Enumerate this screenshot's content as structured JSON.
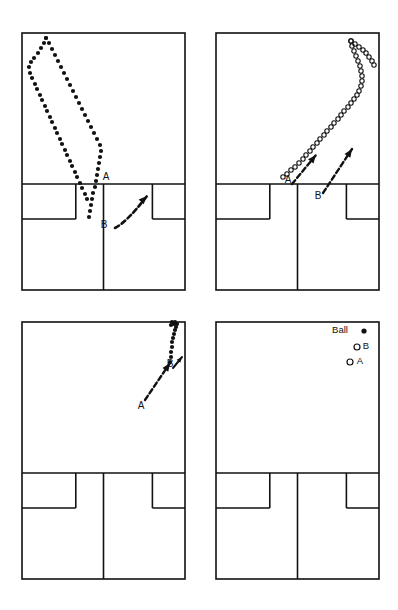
{
  "figure": {
    "type": "diagram",
    "background_color": "#ffffff",
    "line_color": "#111111",
    "panel_count": 4,
    "panel_grid": {
      "rows": 2,
      "cols": 2
    }
  },
  "court": {
    "description": "half badminton court viewed from above, drawn as outer rectangle with net line, short service line, centre line and two service boxes",
    "stroke_color": "#111111",
    "stroke_width": 1.6
  },
  "panels": [
    {
      "id": "panel-1",
      "position": "top-left",
      "x": 22,
      "y": 33,
      "w": 163,
      "h": 257,
      "net_y": 184,
      "service_line_y": 219,
      "labels": [
        {
          "name": "label-a",
          "text": "A",
          "x": 106,
          "y": 180
        },
        {
          "name": "label-b",
          "text": "B",
          "x": 104,
          "y": 228
        }
      ],
      "marker_style": "filled",
      "trajectories": [
        {
          "name": "ball-trajectory-outbound",
          "marker": "filled-dot",
          "points": [
            [
              87,
              199
            ],
            [
              85,
              194
            ],
            [
              82,
              188
            ],
            [
              80,
              183
            ],
            [
              77,
              177
            ],
            [
              75,
              172
            ],
            [
              72,
              166
            ],
            [
              70,
              161
            ],
            [
              67,
              155
            ],
            [
              65,
              150
            ],
            [
              62,
              144
            ],
            [
              60,
              139
            ],
            [
              57,
              133
            ],
            [
              55,
              128
            ],
            [
              52,
              122
            ],
            [
              50,
              117
            ],
            [
              47,
              111
            ],
            [
              45,
              106
            ],
            [
              42,
              100
            ],
            [
              40,
              95
            ],
            [
              37,
              89
            ],
            [
              35,
              84
            ],
            [
              32,
              78
            ],
            [
              30,
              73
            ],
            [
              29,
              67
            ],
            [
              31,
              62
            ],
            [
              34,
              58
            ],
            [
              38,
              53
            ],
            [
              41,
              48
            ],
            [
              44,
              43
            ],
            [
              46,
              38
            ]
          ]
        },
        {
          "name": "ball-trajectory-return",
          "marker": "filled-dot",
          "points": [
            [
              46,
              38
            ],
            [
              49,
              43
            ],
            [
              52,
              49
            ],
            [
              55,
              55
            ],
            [
              58,
              61
            ],
            [
              61,
              67
            ],
            [
              64,
              73
            ],
            [
              67,
              79
            ],
            [
              70,
              85
            ],
            [
              73,
              91
            ],
            [
              76,
              97
            ],
            [
              79,
              103
            ],
            [
              82,
              109
            ],
            [
              85,
              115
            ],
            [
              88,
              121
            ],
            [
              91,
              127
            ],
            [
              94,
              133
            ],
            [
              97,
              139
            ],
            [
              100,
              145
            ],
            [
              101,
              151
            ],
            [
              100,
              157
            ],
            [
              99,
              163
            ],
            [
              98,
              169
            ],
            [
              97,
              175
            ],
            [
              96,
              181
            ],
            [
              95,
              187
            ],
            [
              93,
              193
            ],
            [
              92,
              199
            ],
            [
              91,
              205
            ],
            [
              90,
              211
            ],
            [
              89,
              217
            ]
          ]
        }
      ],
      "arrows": [
        {
          "name": "player-b-move-arrow",
          "style": "dashed-curved",
          "from": [
            115,
            228
          ],
          "to": [
            147,
            196
          ],
          "label": "B"
        }
      ]
    },
    {
      "id": "panel-2",
      "position": "top-right",
      "x": 216,
      "y": 33,
      "w": 163,
      "h": 257,
      "net_y": 184,
      "service_line_y": 219,
      "labels": [
        {
          "name": "label-a",
          "text": "A",
          "x": 288,
          "y": 183
        },
        {
          "name": "label-b",
          "text": "B",
          "x": 318,
          "y": 199
        }
      ],
      "marker_style": "open",
      "trajectories": [
        {
          "name": "ball-trajectory-outbound",
          "marker": "open-circle",
          "points": [
            [
              283,
              177
            ],
            [
              287,
              174
            ],
            [
              291,
              170
            ],
            [
              295,
              167
            ],
            [
              299,
              163
            ],
            [
              303,
              159
            ],
            [
              306,
              155
            ],
            [
              310,
              151
            ],
            [
              313,
              147
            ],
            [
              317,
              143
            ],
            [
              320,
              139
            ],
            [
              324,
              135
            ],
            [
              327,
              131
            ],
            [
              331,
              127
            ],
            [
              334,
              123
            ],
            [
              338,
              119
            ],
            [
              341,
              115
            ],
            [
              344,
              111
            ],
            [
              348,
              107
            ],
            [
              351,
              103
            ],
            [
              354,
              99
            ],
            [
              357,
              95
            ],
            [
              359,
              91
            ],
            [
              361,
              86
            ],
            [
              362,
              81
            ],
            [
              362,
              76
            ],
            [
              361,
              71
            ],
            [
              360,
              66
            ],
            [
              358,
              61
            ],
            [
              356,
              56
            ],
            [
              354,
              51
            ],
            [
              352,
              46
            ],
            [
              351,
              41
            ]
          ]
        },
        {
          "name": "ball-trajectory-return",
          "marker": "open-circle",
          "points": [
            [
              351,
              41
            ],
            [
              355,
              44
            ],
            [
              359,
              47
            ],
            [
              363,
              50
            ],
            [
              366,
              53
            ],
            [
              369,
              57
            ],
            [
              372,
              61
            ],
            [
              374,
              65
            ]
          ]
        }
      ],
      "arrows": [
        {
          "name": "player-a-move-arrow",
          "style": "dashed-straight",
          "from": [
            292,
            184
          ],
          "to": [
            316,
            155
          ],
          "label": "A"
        },
        {
          "name": "player-b-move-arrow",
          "style": "dashed-straight",
          "from": [
            323,
            193
          ],
          "to": [
            352,
            149
          ],
          "label": "B"
        }
      ]
    },
    {
      "id": "panel-3",
      "position": "bottom-left",
      "x": 22,
      "y": 322,
      "w": 163,
      "h": 257,
      "net_y": 473,
      "service_line_y": 508,
      "labels": [
        {
          "name": "label-a",
          "text": "A",
          "x": 141,
          "y": 409
        },
        {
          "name": "label-b",
          "text": "B",
          "x": 170,
          "y": 367
        }
      ],
      "marker_style": "filled",
      "trajectories": [
        {
          "name": "ball-trajectory",
          "marker": "filled-dot",
          "points": [
            [
              170,
              362
            ],
            [
              171,
              357
            ],
            [
              171,
              352
            ],
            [
              172,
              347
            ],
            [
              172,
              342
            ],
            [
              173,
              338
            ],
            [
              174,
              334
            ],
            [
              175,
              330
            ],
            [
              176,
              327
            ],
            [
              177,
              324
            ],
            [
              174,
              324
            ],
            [
              171,
              325
            ],
            [
              175,
              322
            ],
            [
              172,
              322
            ]
          ]
        }
      ],
      "arrows": [
        {
          "name": "player-a-move-arrow",
          "style": "dashed-straight",
          "from": [
            145,
            400
          ],
          "to": [
            170,
            363
          ],
          "label": "A"
        },
        {
          "name": "player-b-move-arrow",
          "style": "short-straight",
          "from": [
            173,
            368
          ],
          "to": [
            182,
            357
          ],
          "label": "B"
        }
      ]
    },
    {
      "id": "panel-4",
      "position": "bottom-right",
      "x": 216,
      "y": 322,
      "w": 163,
      "h": 257,
      "net_y": 473,
      "service_line_y": 508,
      "labels": [],
      "marker_style": "legend-only",
      "trajectories": [],
      "arrows": []
    }
  ],
  "legend": {
    "name": "legend",
    "panel": "panel-4",
    "items": [
      {
        "name": "legend-item-ball",
        "label": "Ball",
        "marker": "filled-dot",
        "label_x": 340,
        "label_y": 333,
        "marker_x": 364,
        "marker_y": 331
      },
      {
        "name": "legend-item-b",
        "label": "B",
        "marker": "open-circle",
        "label_x": 366,
        "label_y": 349,
        "marker_x": 357,
        "marker_y": 347
      },
      {
        "name": "legend-item-a",
        "label": "A",
        "marker": "open-circle",
        "label_x": 360,
        "label_y": 364,
        "marker_x": 350,
        "marker_y": 362
      }
    ]
  }
}
